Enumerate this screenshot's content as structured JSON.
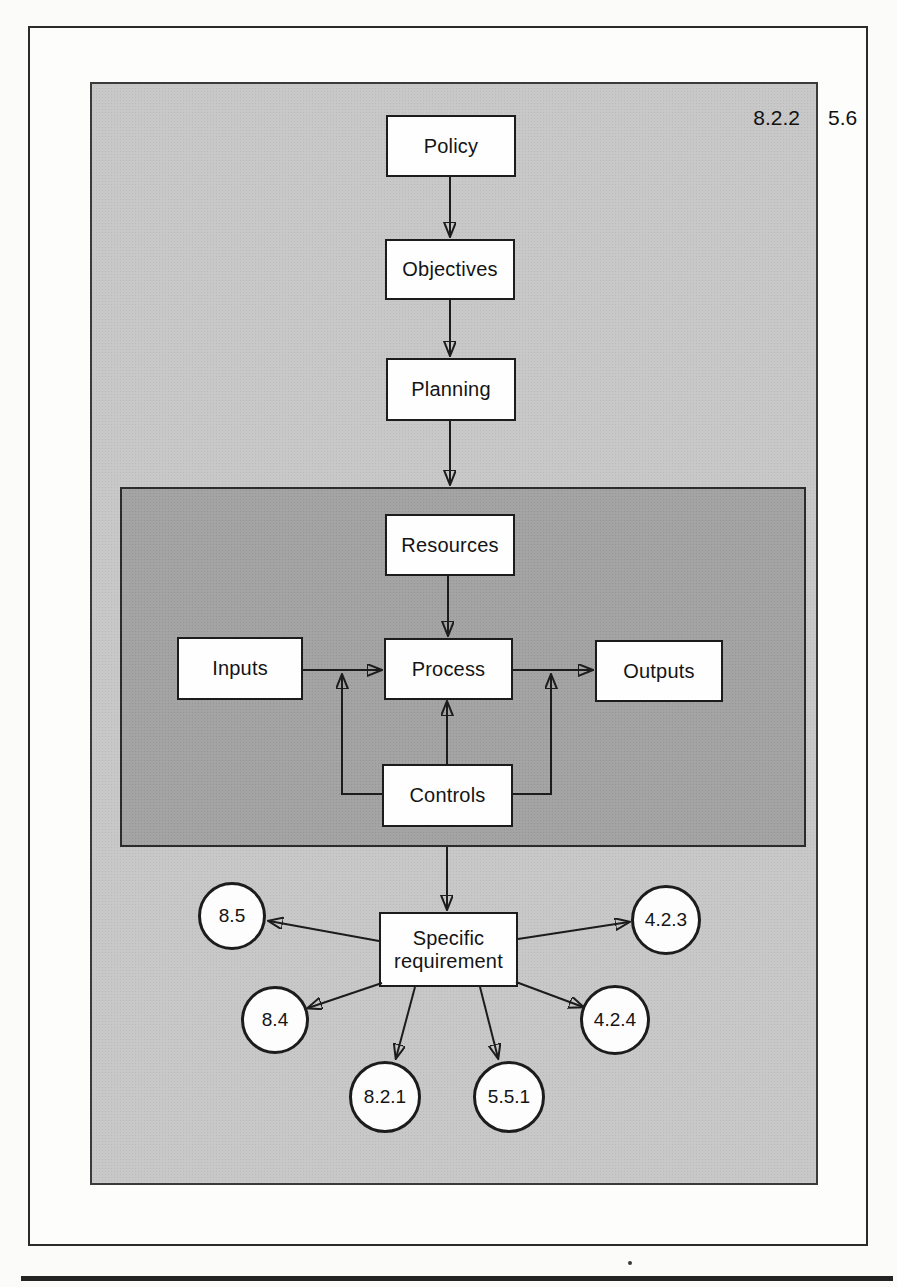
{
  "figure": {
    "clause_labels": {
      "inner": "8.2.2",
      "outer": "5.6"
    },
    "flow": {
      "policy": "Policy",
      "objectives": "Objectives",
      "planning": "Planning"
    },
    "process_model": {
      "resources": "Resources",
      "inputs": "Inputs",
      "process": "Process",
      "outputs": "Outputs",
      "controls": "Controls"
    },
    "requirement": {
      "line1": "Specific",
      "line2": "requirement"
    },
    "clause_circles": [
      {
        "label": "8.5"
      },
      {
        "label": "4.2.3"
      },
      {
        "label": "8.4"
      },
      {
        "label": "4.2.4"
      },
      {
        "label": "8.2.1"
      },
      {
        "label": "5.5.1"
      }
    ],
    "colors": {
      "panel_light": "#c8c8c8",
      "panel_dark": "#a4a4a4",
      "node_fill": "#ffffff",
      "line": "#1c1c1c"
    }
  }
}
